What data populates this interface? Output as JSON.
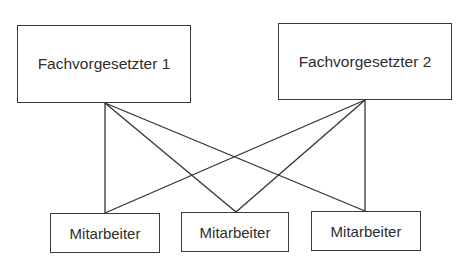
{
  "diagram": {
    "type": "org-chart",
    "line_color": "#333333",
    "supervisors": [
      {
        "id": "sup1",
        "label": "Fachvorgesetzter 1"
      },
      {
        "id": "sup2",
        "label": "Fachvorgesetzter 2"
      }
    ],
    "employees": [
      {
        "id": "emp1",
        "label": "Mitarbeiter"
      },
      {
        "id": "emp2",
        "label": "Mitarbeiter"
      },
      {
        "id": "emp3",
        "label": "Mitarbeiter"
      }
    ],
    "connections": [
      {
        "from": "sup1",
        "to": "emp1"
      },
      {
        "from": "sup1",
        "to": "emp2"
      },
      {
        "from": "sup1",
        "to": "emp3"
      },
      {
        "from": "sup2",
        "to": "emp1"
      },
      {
        "from": "sup2",
        "to": "emp2"
      },
      {
        "from": "sup2",
        "to": "emp3"
      }
    ]
  }
}
